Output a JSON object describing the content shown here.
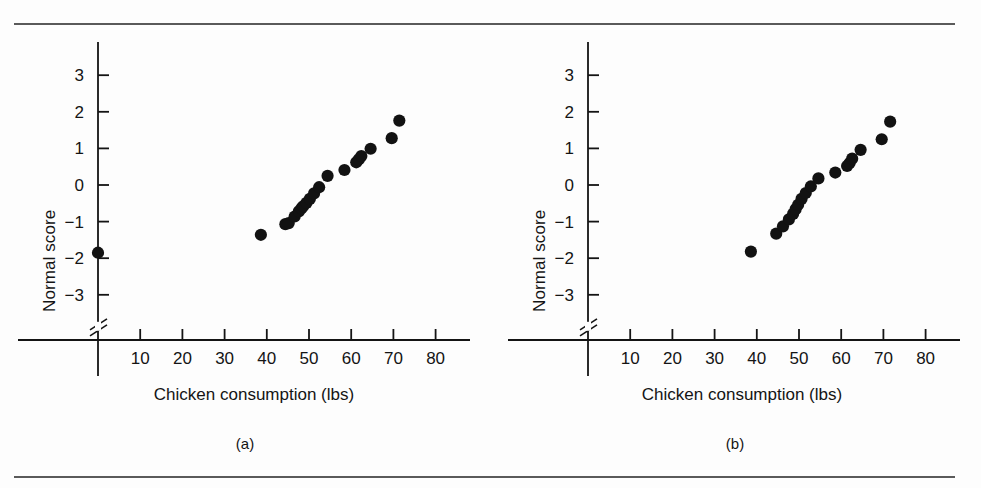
{
  "figure": {
    "background": "#fdfdfd",
    "ink": "#141414",
    "rule_color": "#5a5a5a"
  },
  "panels": [
    {
      "caption": "(a)",
      "xlabel": "Chicken consumption (lbs)",
      "ylabel": "Normal score"
    },
    {
      "caption": "(b)",
      "xlabel": "Chicken consumption (lbs)",
      "ylabel": "Normal score"
    }
  ],
  "chart_data": [
    {
      "type": "scatter",
      "title": "(a)",
      "xlabel": "Chicken consumption (lbs)",
      "ylabel": "Normal score",
      "xlim": [
        0,
        85
      ],
      "ylim": [
        -3.6,
        3.6
      ],
      "xticks": [
        10,
        20,
        30,
        40,
        50,
        60,
        70,
        80
      ],
      "yticks": [
        3,
        2,
        1,
        0,
        -1,
        -2,
        -3
      ],
      "ytick_labels": [
        "3",
        "2",
        "1",
        "0",
        "−1",
        "−2",
        "−3"
      ],
      "grid": false,
      "legend": "none",
      "axis_break_y": true,
      "x": [
        0.0,
        38.6,
        44.4,
        45.2,
        46.6,
        47.6,
        48.2,
        48.6,
        49.4,
        50.2,
        51.2,
        52.4,
        54.4,
        58.4,
        61.2,
        61.8,
        62.4,
        64.6,
        69.6,
        71.4
      ],
      "y": [
        -1.85,
        -1.36,
        -1.07,
        -1.04,
        -0.86,
        -0.72,
        -0.64,
        -0.58,
        -0.49,
        -0.38,
        -0.23,
        -0.06,
        0.25,
        0.41,
        0.62,
        0.7,
        0.79,
        0.99,
        1.28,
        1.76
      ]
    },
    {
      "type": "scatter",
      "title": "(b)",
      "xlabel": "Chicken consumption (lbs)",
      "ylabel": "Normal score",
      "xlim": [
        0,
        85
      ],
      "ylim": [
        -3.6,
        3.6
      ],
      "xticks": [
        10,
        20,
        30,
        40,
        50,
        60,
        70,
        80
      ],
      "yticks": [
        3,
        2,
        1,
        0,
        -1,
        -2,
        -3
      ],
      "ytick_labels": [
        "3",
        "2",
        "1",
        "0",
        "−1",
        "−2",
        "−3"
      ],
      "grid": false,
      "legend": "none",
      "axis_break_y": true,
      "x": [
        38.6,
        44.6,
        46.2,
        47.6,
        48.6,
        49.2,
        49.8,
        50.6,
        51.6,
        52.8,
        54.6,
        58.6,
        61.4,
        62.0,
        62.6,
        64.6,
        69.6,
        71.6
      ],
      "y": [
        -1.82,
        -1.33,
        -1.13,
        -0.94,
        -0.79,
        -0.66,
        -0.54,
        -0.38,
        -0.22,
        -0.04,
        0.18,
        0.34,
        0.52,
        0.6,
        0.72,
        0.96,
        1.25,
        1.73
      ]
    }
  ]
}
